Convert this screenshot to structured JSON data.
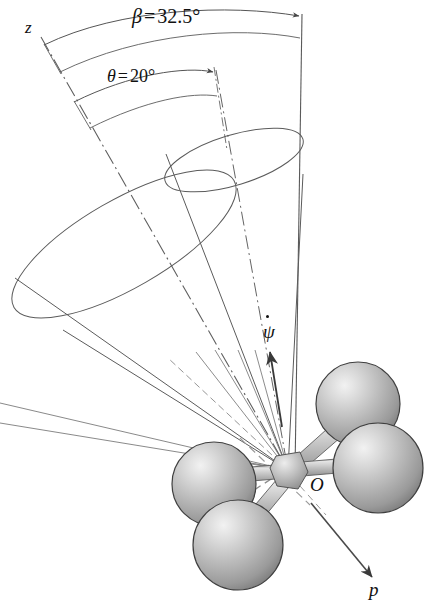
{
  "figure": {
    "kind": "engineering-mechanics-diagram",
    "width": 425,
    "height": 609,
    "background_color": "#ffffff",
    "line_color": "#555555",
    "text_color": "#111111"
  },
  "labels": {
    "beta": {
      "symbol": "β",
      "equals": "=",
      "value": "32.5",
      "degree": "°",
      "full": "β = 32.5°"
    },
    "theta": {
      "symbol": "θ",
      "equals": "=",
      "value": "20",
      "degree": "°",
      "full": "θ = 20°"
    },
    "z_axis": "z",
    "psi_dot": "ψ",
    "origin": "O",
    "spin_axis": "p"
  },
  "annotations": {
    "outer_cone_label": "space cone half-angle beta",
    "inner_cone_label": "body cone half-angle theta",
    "precession_arrow": "psi-dot precession rate",
    "spin_arrow": "p spin axis"
  },
  "geometry": {
    "apex": {
      "x": 288,
      "y": 470
    },
    "vertical_axis": {
      "x1": 302,
      "y1": 14,
      "x2": 296,
      "y2": 470
    },
    "outer_cone_rim_center": {
      "x": 124,
      "y": 245
    },
    "inner_cone_rim_center": {
      "x": 233,
      "y": 160
    },
    "sphere_count": 4,
    "sphere_radius": 45
  },
  "colors": {
    "sphere_light": "#e8e8e8",
    "sphere_mid": "#b4b4b4",
    "sphere_dark": "#8a8a8a",
    "sphere_edge": "#3c3c3c",
    "rod_light": "#dcdcdc",
    "rod_mid": "#b0b0b0",
    "rod_dark": "#868686",
    "line": "#555555",
    "dashdot": "#666666",
    "text": "#111111"
  }
}
